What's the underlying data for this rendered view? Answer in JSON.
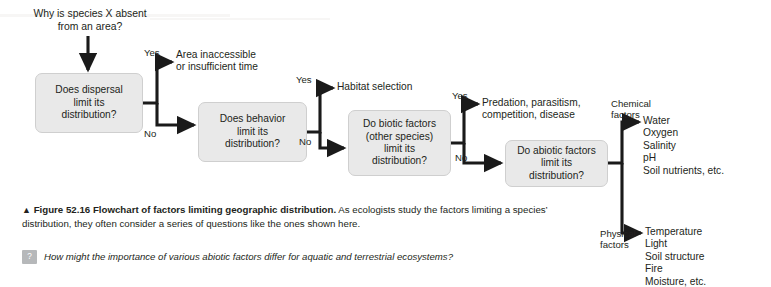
{
  "figure": {
    "prompt": "Why is species X absent\nfrom an area?",
    "boxes": [
      {
        "id": "dispersal",
        "text": "Does dispersal\nlimit its\ndistribution?"
      },
      {
        "id": "behavior",
        "text": "Does behavior\nlimit its\ndistribution?"
      },
      {
        "id": "biotic",
        "text": "Do biotic factors\n(other species)\nlimit its\ndistribution?"
      },
      {
        "id": "abiotic",
        "text": "Do abiotic factors\nlimit its\ndistribution?"
      }
    ],
    "outcomes": [
      {
        "id": "inaccessible",
        "text": "Area inaccessible\nor insufficient time"
      },
      {
        "id": "habitat",
        "text": "Habitat selection"
      },
      {
        "id": "predation",
        "text": "Predation, parasitism,\ncompetition, disease"
      },
      {
        "id": "chemical-list",
        "text": "Water\nOxygen\nSalinity\npH\nSoil nutrients, etc."
      },
      {
        "id": "physical-list",
        "text": "Temperature\nLight\nSoil structure\nFire\nMoisture, etc."
      }
    ],
    "branch_labels": {
      "dispersal_yes": "Yes",
      "dispersal_no": "No",
      "behavior_yes": "Yes",
      "behavior_no": "No",
      "biotic_yes": "Yes",
      "biotic_no": "No",
      "chemical": "Chemical\nfactors",
      "physical": "Physical\nfactors"
    },
    "colors": {
      "box_fill": "#e9e9e9",
      "box_border": "#cfcfcf",
      "arrow": "#1a1a1a",
      "text": "#231f20",
      "badge": "#b6b8ba"
    }
  },
  "caption": {
    "triangle": "▲",
    "figure_number": "Figure 52.16",
    "title": "Flowchart of factors limiting geographic distribution.",
    "body": " As ecologists study the factors limiting a species’ distribution, they often consider a series of questions like the ones shown here."
  },
  "question": {
    "badge": "?",
    "text": "How might the importance of various abiotic factors differ for aquatic and terrestrial ecosystems?"
  }
}
